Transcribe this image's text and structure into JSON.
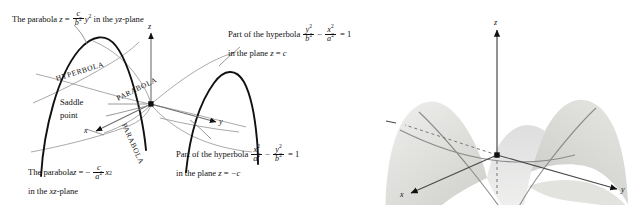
{
  "figure": {
    "left_panel": {
      "name": "labeled-line-diagram",
      "axes": {
        "x": "x",
        "y": "y",
        "z": "z"
      },
      "annotations": {
        "top_left": {
          "line1_pre": "The parabola ",
          "var_z": "z",
          "eq": "=",
          "frac_num": "c",
          "frac_den": "b",
          "frac_den_exp": "2",
          "var_y": "y",
          "y_exp": "2",
          "line1_post": " in the ",
          "plane": "yz",
          "line1_tail": "-plane"
        },
        "top_right": {
          "line1": "Part of the hyperbola",
          "f1_num": "y",
          "f1_num_exp": "2",
          "f1_den": "b",
          "f1_den_exp": "2",
          "minus": "−",
          "f2_num": "x",
          "f2_num_exp": "2",
          "f2_den": "a",
          "f2_den_exp": "2",
          "equals": "= 1",
          "line2_pre": "in the plane ",
          "line2_var": "z",
          "line2_post": " = ",
          "line2_val": "c"
        },
        "bottom_right": {
          "line1": "Part of the hyperbola",
          "f1_num": "x",
          "f1_num_exp": "2",
          "f1_den": "a",
          "f1_den_exp": "2",
          "minus": "−",
          "f2_num": "y",
          "f2_num_exp": "2",
          "f2_den": "b",
          "f2_den_exp": "2",
          "equals": "= 1",
          "line2_pre": "in the plane ",
          "line2_var": "z",
          "line2_post": " = ",
          "line2_val": "−c"
        },
        "bottom_left": {
          "line1_pre": "The parabola ",
          "var_z": "z",
          "eq": "= −",
          "frac_num": "c",
          "frac_den": "a",
          "frac_den_exp": "2",
          "var_x": "x",
          "x_exp": "2",
          "line2_pre": "in the ",
          "plane": "xz",
          "line2_tail": "-plane"
        },
        "saddle": {
          "line1": "Saddle",
          "line2": "point"
        }
      },
      "curve_labels": {
        "hyperbola": "HYPERBOLA",
        "parabola_upper": "PARABOLA",
        "parabola_lower": "PARABOLA"
      }
    },
    "right_panel": {
      "name": "shaded-3d-saddle",
      "axes": {
        "x": "x",
        "y": "y",
        "z": "z"
      },
      "hidden_axis_style": "dashed"
    },
    "colors": {
      "ink": "#111111",
      "gray_curve": "#8e8e8e",
      "light_gray": "#b4b4b4",
      "surface_light": "#e9e9e7",
      "surface_mid": "#dcdcd9",
      "surface_dark": "#c9c9c6",
      "background": "#ffffff"
    }
  }
}
